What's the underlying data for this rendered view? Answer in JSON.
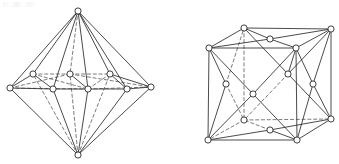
{
  "page": {
    "background_color": "#ffffff",
    "width": 339,
    "height": 164
  },
  "style": {
    "edge_solid_color": "#2b2b2b",
    "edge_dashed_color": "#5a5a5a",
    "node_fill": "#ffffff",
    "node_stroke": "#2b2b2b",
    "node_radius": 3.1,
    "dash_pattern": "3.2 2.6"
  },
  "figures": [
    {
      "id": "left-figure",
      "name": "hexagonal-bipyramid-lattice",
      "caption": "",
      "nodes": [
        {
          "id": "apex_top",
          "name": "top-apex-node",
          "x": 78,
          "y": 11,
          "hidden": false
        },
        {
          "id": "apex_bottom",
          "name": "bottom-apex-node",
          "x": 78,
          "y": 155,
          "hidden": false
        },
        {
          "id": "eq_left",
          "name": "equator-left-node",
          "x": 10,
          "y": 88,
          "hidden": false
        },
        {
          "id": "eq_right",
          "name": "equator-right-node",
          "x": 151,
          "y": 87,
          "hidden": false
        },
        {
          "id": "back_l",
          "name": "back-left-node",
          "x": 33,
          "y": 74,
          "hidden": true
        },
        {
          "id": "back_c",
          "name": "back-center-node",
          "x": 70,
          "y": 74,
          "hidden": true
        },
        {
          "id": "back_r",
          "name": "back-right-node",
          "x": 110,
          "y": 74,
          "hidden": true
        },
        {
          "id": "front_l",
          "name": "front-left-node",
          "x": 53,
          "y": 89,
          "hidden": false
        },
        {
          "id": "front_c",
          "name": "front-center-node",
          "x": 88,
          "y": 89,
          "hidden": false
        },
        {
          "id": "front_r",
          "name": "front-right-node",
          "x": 127,
          "y": 89,
          "hidden": false
        }
      ],
      "edges_solid": [
        [
          "apex_top",
          "eq_left"
        ],
        [
          "apex_top",
          "eq_right"
        ],
        [
          "apex_bottom",
          "eq_left"
        ],
        [
          "apex_bottom",
          "eq_right"
        ],
        [
          "apex_top",
          "front_l"
        ],
        [
          "apex_top",
          "front_c"
        ],
        [
          "apex_top",
          "front_r"
        ],
        [
          "apex_bottom",
          "front_l"
        ],
        [
          "apex_bottom",
          "front_c"
        ],
        [
          "apex_bottom",
          "front_r"
        ],
        [
          "apex_top",
          "back_l"
        ],
        [
          "apex_top",
          "back_r"
        ],
        [
          "eq_left",
          "front_l"
        ],
        [
          "front_l",
          "front_c"
        ],
        [
          "front_c",
          "front_r"
        ],
        [
          "front_r",
          "eq_right"
        ],
        [
          "eq_left",
          "back_l"
        ],
        [
          "back_r",
          "eq_right"
        ],
        [
          "back_l",
          "front_l"
        ],
        [
          "back_c",
          "front_c"
        ],
        [
          "back_r",
          "front_r"
        ]
      ],
      "edges_dashed": [
        [
          "apex_top",
          "back_c"
        ],
        [
          "apex_bottom",
          "back_l"
        ],
        [
          "apex_bottom",
          "back_c"
        ],
        [
          "apex_bottom",
          "back_r"
        ],
        [
          "back_l",
          "back_c"
        ],
        [
          "back_c",
          "back_r"
        ],
        [
          "eq_left",
          "back_c"
        ],
        [
          "back_c",
          "eq_right"
        ],
        [
          "eq_left",
          "front_c"
        ],
        [
          "front_c",
          "eq_right"
        ],
        [
          "back_l",
          "front_c"
        ],
        [
          "back_r",
          "front_c"
        ]
      ]
    },
    {
      "id": "right-figure",
      "name": "face-centered-cubic-lattice",
      "caption": "",
      "nodes": [
        {
          "id": "tfl",
          "name": "top-front-left-corner-node",
          "x": 209,
          "y": 48,
          "hidden": false
        },
        {
          "id": "tfr",
          "name": "top-front-right-corner-node",
          "x": 296,
          "y": 48,
          "hidden": false
        },
        {
          "id": "tbl",
          "name": "top-back-left-corner-node",
          "x": 244,
          "y": 28,
          "hidden": false
        },
        {
          "id": "tbr",
          "name": "top-back-right-corner-node",
          "x": 331,
          "y": 29,
          "hidden": false
        },
        {
          "id": "bfl",
          "name": "bottom-front-left-corner-node",
          "x": 208,
          "y": 140,
          "hidden": false
        },
        {
          "id": "bfr",
          "name": "bottom-front-right-corner-node",
          "x": 297,
          "y": 140,
          "hidden": false
        },
        {
          "id": "bbl",
          "name": "bottom-back-left-corner-node",
          "x": 244,
          "y": 120,
          "hidden": true
        },
        {
          "id": "bbr",
          "name": "bottom-back-right-corner-node",
          "x": 331,
          "y": 119,
          "hidden": false
        },
        {
          "id": "ftop",
          "name": "top-face-center-node",
          "x": 270,
          "y": 39,
          "hidden": false
        },
        {
          "id": "fbot",
          "name": "bottom-face-center-node",
          "x": 270,
          "y": 130,
          "hidden": false
        },
        {
          "id": "ffro",
          "name": "front-face-center-node",
          "x": 253,
          "y": 94,
          "hidden": false
        },
        {
          "id": "fbak",
          "name": "back-face-center-node",
          "x": 288,
          "y": 74,
          "hidden": false
        },
        {
          "id": "flef",
          "name": "left-face-center-node",
          "x": 226,
          "y": 84,
          "hidden": false
        },
        {
          "id": "frig",
          "name": "right-face-center-node",
          "x": 313,
          "y": 84,
          "hidden": false
        }
      ],
      "edges_solid": [
        [
          "tfl",
          "tfr"
        ],
        [
          "tfl",
          "tbl"
        ],
        [
          "tfr",
          "tbr"
        ],
        [
          "tbl",
          "tbr"
        ],
        [
          "bfl",
          "bfr"
        ],
        [
          "bfr",
          "bbr"
        ],
        [
          "tbr",
          "bbr"
        ],
        [
          "tfl",
          "bfl"
        ],
        [
          "tfr",
          "bfr"
        ],
        [
          "ftop",
          "tfl"
        ],
        [
          "ftop",
          "tfr"
        ],
        [
          "ftop",
          "tbl"
        ],
        [
          "ftop",
          "tbr"
        ],
        [
          "fbot",
          "bfl"
        ],
        [
          "fbot",
          "bfr"
        ],
        [
          "fbot",
          "bbr"
        ],
        [
          "ffro",
          "tfl"
        ],
        [
          "ffro",
          "tfr"
        ],
        [
          "ffro",
          "bfl"
        ],
        [
          "ffro",
          "bfr"
        ],
        [
          "flef",
          "tfl"
        ],
        [
          "flef",
          "bfl"
        ],
        [
          "frig",
          "tfr"
        ],
        [
          "frig",
          "bfr"
        ],
        [
          "frig",
          "tbr"
        ],
        [
          "frig",
          "bbr"
        ],
        [
          "fbak",
          "tbl"
        ],
        [
          "fbak",
          "tbr"
        ],
        [
          "fbak",
          "bbr"
        ],
        [
          "fbak",
          "tfr"
        ]
      ],
      "edges_dashed": [
        [
          "tbl",
          "bbl"
        ],
        [
          "bbl",
          "bfl"
        ],
        [
          "bbl",
          "bbr"
        ],
        [
          "fbot",
          "bbl"
        ],
        [
          "flef",
          "tbl"
        ],
        [
          "flef",
          "bbl"
        ],
        [
          "fbak",
          "bbl"
        ]
      ]
    }
  ]
}
